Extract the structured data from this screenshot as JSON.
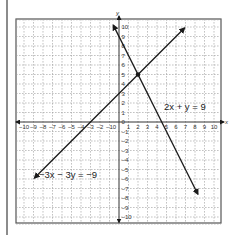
{
  "chart_data": {
    "type": "line",
    "title": "",
    "xlabel": "x",
    "ylabel": "y",
    "xlim": [
      -10,
      10
    ],
    "ylim": [
      -10,
      10
    ],
    "grid": true,
    "grid_style": "dashed",
    "x_ticks": [
      "-10",
      "-9",
      "-8",
      "-7",
      "-6",
      "-5",
      "-4",
      "-3",
      "-2",
      "-1",
      "0",
      "1",
      "2",
      "3",
      "4",
      "5",
      "6",
      "7",
      "8",
      "9",
      "10"
    ],
    "y_ticks": [
      "10",
      "9",
      "8",
      "7",
      "6",
      "5",
      "4",
      "3",
      "2",
      "1",
      "0",
      "-1",
      "-2",
      "-3",
      "-4",
      "-5",
      "-6",
      "-7",
      "-8",
      "-9",
      "-10"
    ],
    "series": [
      {
        "name": "2x + y = 9",
        "label": "2x + y = 9",
        "x": [
          -0.6,
          8.3
        ],
        "y": [
          10.2,
          -7.6
        ],
        "arrows": "both"
      },
      {
        "name": "-3x - 3y = -9",
        "label": "−3x − 3y = −9",
        "x": [
          -8.9,
          6.9
        ],
        "y": [
          -5.9,
          9.9
        ],
        "arrows": "both"
      }
    ],
    "annotations": [
      {
        "type": "point",
        "x": 2,
        "y": 5,
        "description": "intersection"
      }
    ],
    "colors": {
      "lines": "#1a1a1a",
      "grid": "#9a9a9a",
      "border": "#555555"
    }
  },
  "labels": {
    "x_axis": "x",
    "y_axis": "y",
    "eq1": "2x + y = 9",
    "eq2": "−3x − 3y = −9"
  }
}
